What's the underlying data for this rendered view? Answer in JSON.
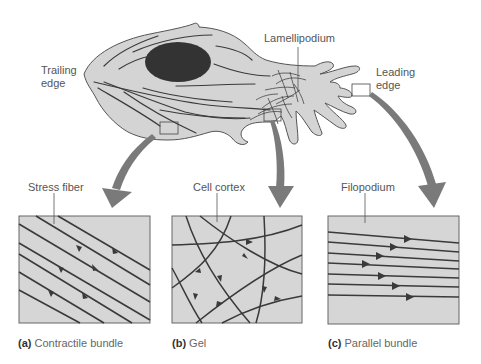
{
  "cell_labels": {
    "trailing_edge_line1": "Trailing",
    "trailing_edge_line2": "edge",
    "lamellipodium": "Lamellipodium",
    "leading_edge_line1": "Leading",
    "leading_edge_line2": "edge"
  },
  "panels": [
    {
      "id": "a",
      "letter": "(a)",
      "caption": "Contractile bundle",
      "callout": "Stress fiber"
    },
    {
      "id": "b",
      "letter": "(b)",
      "caption": "Gel",
      "callout": "Cell cortex"
    },
    {
      "id": "c",
      "letter": "(c)",
      "caption": "Parallel bundle",
      "callout": "Filopodium"
    }
  ],
  "colors": {
    "cell_fill": "#d4d4d4",
    "outline": "#555555",
    "nucleus": "#333333",
    "filament": "#3a3a3a",
    "arrow": "#777777",
    "panel_fill": "#d6d6d6"
  }
}
